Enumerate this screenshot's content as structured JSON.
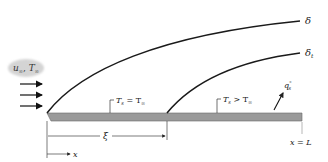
{
  "diagram": {
    "free_stream": {
      "velocity": "u",
      "velocity_sub": "∞",
      "temperature": "T",
      "temperature_sub": "∞"
    },
    "curves": {
      "velocity_bl_label": "δ",
      "thermal_bl_label": "δ",
      "thermal_bl_sub": "t"
    },
    "regions": {
      "unheated": {
        "T": "T",
        "sub": "s",
        "relation": " = T",
        "rel_sub": "∞"
      },
      "heated": {
        "T": "T",
        "sub": "s",
        "relation": " > T",
        "rel_sub": "∞"
      }
    },
    "heat_flux": {
      "q": "q",
      "sup": "\"",
      "sub": "s"
    },
    "dimensions": {
      "xi": "ξ",
      "x_axis": "x",
      "end_label": "x = L"
    },
    "colors": {
      "plate_fill": "#9a9a9a",
      "plate_edge": "#6a6a6a",
      "curve": "#1a1a1a",
      "cloud": "#d4d4d4"
    }
  }
}
